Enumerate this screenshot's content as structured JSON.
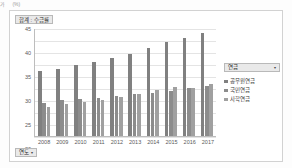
{
  "sheet_strip": {
    "cells": [
      "가",
      "(%)"
    ]
  },
  "chart": {
    "title_button": "합계 : 수급률",
    "row_field_button": "연도",
    "row_field_caret": "▾",
    "legend_field": "연금",
    "legend_caret": "▾"
  },
  "chart_data": {
    "type": "bar",
    "title": "합계 : 수급률",
    "xlabel": "연도",
    "ylabel": "",
    "ylim": [
      0,
      45
    ],
    "yticks": [
      0,
      5,
      10,
      15,
      20,
      25,
      30,
      35,
      40,
      45
    ],
    "grid": true,
    "legend_position": "right",
    "categories": [
      "2008",
      "2009",
      "2010",
      "2011",
      "2012",
      "2013",
      "2014",
      "2015",
      "2016",
      "2017"
    ],
    "series": [
      {
        "name": "공무원연금",
        "color": "#808080",
        "values": [
          27.0,
          27.8,
          29.5,
          31.0,
          32.5,
          34.0,
          36.5,
          39.0,
          41.0,
          43.0
        ]
      },
      {
        "name": "국민연금",
        "color": "#8c8c8c",
        "values": [
          13.8,
          15.0,
          15.5,
          16.0,
          16.8,
          17.5,
          17.8,
          18.8,
          20.0,
          21.0
        ]
      },
      {
        "name": "사학연금",
        "color": "#a0a0a0",
        "values": [
          12.2,
          13.2,
          14.0,
          15.0,
          16.2,
          17.3,
          19.0,
          20.5,
          20.2,
          21.5
        ]
      }
    ]
  }
}
